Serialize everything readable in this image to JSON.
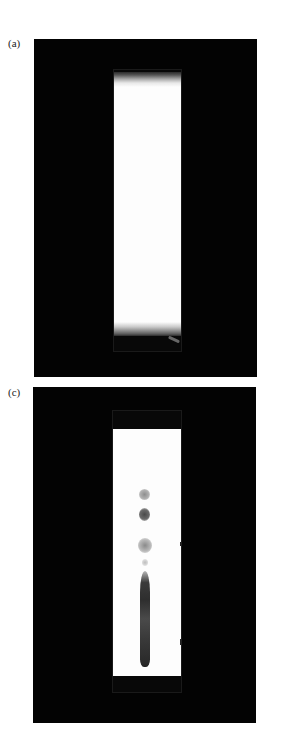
{
  "figure": {
    "panels": [
      {
        "id": "a",
        "label": "(a)",
        "description": "Blank chromatography strip on black background",
        "spots": []
      },
      {
        "id": "c",
        "label": "(c)",
        "description": "Developed chromatography strip with separated spots and streak",
        "spots": [
          {
            "name": "spot-1",
            "tone": "light"
          },
          {
            "name": "spot-2",
            "tone": "dark"
          },
          {
            "name": "spot-3",
            "tone": "light"
          },
          {
            "name": "spot-4",
            "tone": "faint"
          },
          {
            "name": "streak",
            "tone": "dark"
          }
        ]
      }
    ],
    "colors": {
      "background": "#ffffff",
      "panel": "#030303",
      "strip": "#fdfdfd",
      "spot_dark": "#3a3a3a",
      "spot_light": "#9a9a9a"
    }
  }
}
